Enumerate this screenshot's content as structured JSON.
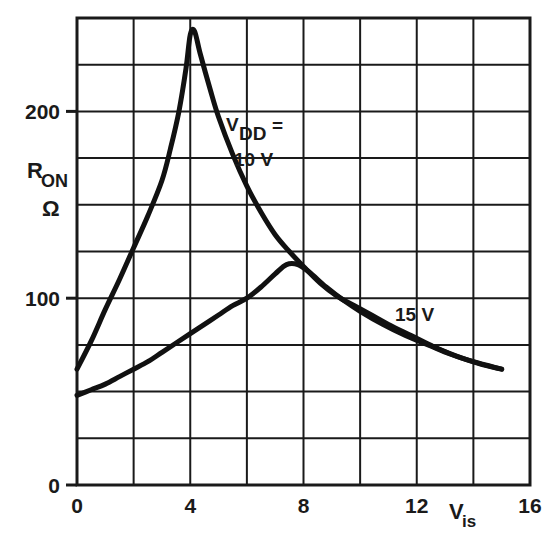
{
  "chart_data": {
    "type": "line",
    "title": "",
    "xlabel": "V_is",
    "ylabel": "R_ON",
    "ylabel_unit": "Ω",
    "xlim": [
      0,
      16
    ],
    "ylim": [
      0,
      250
    ],
    "grid": true,
    "x_ticks": [
      0,
      4,
      8,
      12,
      16
    ],
    "x_tick_labels": [
      "0",
      "4",
      "8",
      "12",
      "16"
    ],
    "x_gridlines": [
      0,
      2,
      4,
      6,
      8,
      10,
      12,
      14,
      16
    ],
    "y_ticks": [
      0,
      100,
      200
    ],
    "y_tick_labels": [
      "0",
      "100",
      "200"
    ],
    "y_gridlines": [
      0,
      25,
      50,
      75,
      100,
      125,
      150,
      175,
      200,
      225,
      250
    ],
    "legend_position": "inline-annotations",
    "series": [
      {
        "name": "VDD = 10 V",
        "annotation": "V DD = 10 V",
        "points": [
          [
            0.0,
            62
          ],
          [
            0.5,
            77
          ],
          [
            1.0,
            94
          ],
          [
            1.5,
            110
          ],
          [
            2.0,
            127
          ],
          [
            2.5,
            144
          ],
          [
            3.0,
            163
          ],
          [
            3.3,
            180
          ],
          [
            3.6,
            200
          ],
          [
            3.85,
            223
          ],
          [
            4.0,
            241
          ],
          [
            4.15,
            243
          ],
          [
            4.35,
            231
          ],
          [
            4.7,
            212
          ],
          [
            5.0,
            197
          ],
          [
            5.5,
            177
          ],
          [
            6.0,
            160
          ],
          [
            6.5,
            146
          ],
          [
            7.0,
            134
          ],
          [
            7.5,
            125
          ],
          [
            8.0,
            117
          ],
          [
            8.6,
            108
          ],
          [
            9.2,
            101
          ],
          [
            9.8,
            96
          ],
          [
            10.4,
            91
          ],
          [
            11.0,
            86
          ],
          [
            11.8,
            80
          ],
          [
            12.6,
            74
          ],
          [
            13.4,
            69
          ],
          [
            14.2,
            65
          ],
          [
            15.0,
            62
          ]
        ]
      },
      {
        "name": "15 V",
        "annotation": "15 V",
        "points": [
          [
            0.0,
            48
          ],
          [
            0.5,
            51
          ],
          [
            1.0,
            54
          ],
          [
            1.5,
            58
          ],
          [
            2.0,
            62
          ],
          [
            2.5,
            66
          ],
          [
            3.0,
            71
          ],
          [
            3.5,
            76
          ],
          [
            4.0,
            81
          ],
          [
            4.5,
            86
          ],
          [
            5.0,
            91
          ],
          [
            5.5,
            96
          ],
          [
            6.0,
            100
          ],
          [
            6.5,
            106
          ],
          [
            7.0,
            113
          ],
          [
            7.4,
            118
          ],
          [
            7.8,
            118
          ],
          [
            8.2,
            114
          ],
          [
            8.8,
            106
          ],
          [
            9.4,
            99
          ],
          [
            10.0,
            93
          ],
          [
            10.8,
            86
          ],
          [
            11.6,
            80
          ],
          [
            12.4,
            75
          ],
          [
            13.2,
            70
          ],
          [
            14.0,
            66
          ],
          [
            15.0,
            62
          ]
        ]
      }
    ],
    "annotations": [
      {
        "id": "vdd-10v",
        "line1_pre": "V",
        "line1_sub": "DD",
        "line1_post": "=",
        "line2": "10 V",
        "x": 6.0,
        "y": 185
      },
      {
        "id": "15v",
        "text": "15 V",
        "x": 12.2,
        "y": 88
      }
    ]
  },
  "axis": {
    "y_label_main": "R",
    "y_label_sub": "ON",
    "y_label_unit": "Ω",
    "x_label_main": "V",
    "x_label_sub": "is"
  },
  "colors": {
    "background": "#ffffff",
    "axis": "#1a1a1a",
    "grid": "#1a1a1a",
    "curve": "#111111",
    "text": "#1a1a1a"
  }
}
